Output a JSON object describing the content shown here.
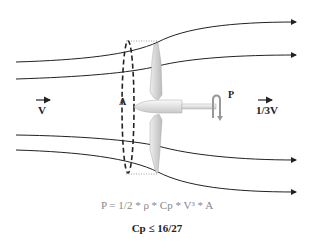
{
  "diagram": {
    "labels": {
      "inflow_velocity": "V",
      "outflow_velocity": "1/3V",
      "area": "A",
      "power": "P"
    },
    "formula": "P = 1/2 * ρ * Cp * V³ * A",
    "limit": "Cp ≤ 16/27",
    "colors": {
      "stream_line": "#222222",
      "blade": "#d8d8d8",
      "formula_text": "#888888"
    }
  }
}
